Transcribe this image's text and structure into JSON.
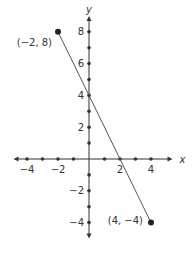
{
  "chart_data": {
    "type": "line",
    "title": "",
    "xlabel": "x",
    "ylabel": "y",
    "xlim": [
      -5,
      5
    ],
    "ylim": [
      -5,
      9
    ],
    "x_ticks": [
      -4,
      -3,
      -2,
      -1,
      1,
      2,
      3,
      4
    ],
    "y_ticks": [
      -4,
      -3,
      -2,
      -1,
      1,
      2,
      3,
      4,
      5,
      6,
      7,
      8
    ],
    "x_tick_labels": [
      {
        "value": -4,
        "label": "−4"
      },
      {
        "value": -2,
        "label": "−2"
      },
      {
        "value": 2,
        "label": "2"
      },
      {
        "value": 4,
        "label": "4"
      }
    ],
    "y_tick_labels": [
      {
        "value": 8,
        "label": "8"
      },
      {
        "value": 6,
        "label": "6"
      },
      {
        "value": 4,
        "label": "4"
      },
      {
        "value": 2,
        "label": "2"
      },
      {
        "value": -2,
        "label": "−2"
      },
      {
        "value": -4,
        "label": "−4"
      }
    ],
    "grid": false,
    "series": [
      {
        "name": "line",
        "points": [
          {
            "x": -2,
            "y": 8,
            "label": "(−2, 8)"
          },
          {
            "x": 4,
            "y": -4,
            "label": "(4, −4)"
          }
        ]
      }
    ],
    "intercepts": {
      "x": 2,
      "y": 4
    },
    "colors": {
      "axis": "#333333",
      "line": "#555555",
      "point": "#222222"
    }
  }
}
